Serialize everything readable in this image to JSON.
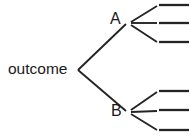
{
  "diagram": {
    "type": "probability-tree-diagram",
    "background_color": "#ffffff",
    "line_color": "#242424",
    "root": {
      "label": "outcome",
      "x": 78,
      "y": 70
    },
    "nodes": [
      {
        "id": "A",
        "label": "A",
        "x": 128,
        "y": 23,
        "label_x": 110,
        "label_y": 11
      },
      {
        "id": "B",
        "label": "B",
        "x": 128,
        "y": 112,
        "label_x": 111,
        "label_y": 103
      }
    ],
    "root_edges": [
      {
        "name": "root-to-A",
        "x1": 78,
        "y1": 70,
        "x2": 126,
        "y2": 24
      },
      {
        "name": "root-to-B",
        "x1": 78,
        "y1": 70,
        "x2": 126,
        "y2": 111
      }
    ],
    "branch_edges": [
      {
        "name": "A-branch-1",
        "x1": 131,
        "y1": 22,
        "x2": 157,
        "y2": 6
      },
      {
        "name": "A-branch-2",
        "x1": 131,
        "y1": 23,
        "x2": 157,
        "y2": 23
      },
      {
        "name": "A-branch-3",
        "x1": 131,
        "y1": 25,
        "x2": 157,
        "y2": 42
      },
      {
        "name": "B-branch-1",
        "x1": 131,
        "y1": 110,
        "x2": 157,
        "y2": 92
      },
      {
        "name": "B-branch-2",
        "x1": 131,
        "y1": 112,
        "x2": 157,
        "y2": 111
      },
      {
        "name": "B-branch-3",
        "x1": 131,
        "y1": 114,
        "x2": 157,
        "y2": 130
      }
    ],
    "leaf_stubs": [
      {
        "name": "leaf-stub-a1",
        "x1": 159,
        "y1": 5,
        "x2": 189,
        "y2": 5
      },
      {
        "name": "leaf-stub-a2",
        "x1": 159,
        "y1": 23,
        "x2": 189,
        "y2": 23
      },
      {
        "name": "leaf-stub-a3",
        "x1": 159,
        "y1": 42,
        "x2": 189,
        "y2": 42
      },
      {
        "name": "leaf-stub-b1",
        "x1": 159,
        "y1": 91,
        "x2": 189,
        "y2": 91
      },
      {
        "name": "leaf-stub-b2",
        "x1": 159,
        "y1": 110,
        "x2": 189,
        "y2": 110
      },
      {
        "name": "leaf-stub-b3",
        "x1": 159,
        "y1": 130,
        "x2": 189,
        "y2": 130
      }
    ]
  }
}
